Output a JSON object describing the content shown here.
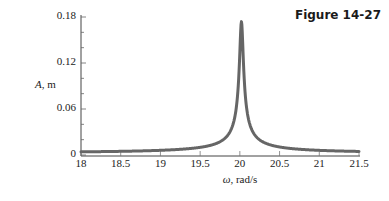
{
  "figure": {
    "label": "Figure 14-27"
  },
  "chart_data": {
    "type": "line",
    "title": "",
    "xlabel": "ω, rad/s",
    "ylabel": "A, m",
    "xlim": [
      18,
      21.5
    ],
    "ylim": [
      0,
      0.18
    ],
    "x_ticks": [
      "18",
      "18.5",
      "19",
      "19.5",
      "20",
      "20.5",
      "21",
      "21.5"
    ],
    "y_ticks": [
      "0",
      "0.06",
      "0.12",
      "0.18"
    ],
    "grid": false,
    "legend": null,
    "series": [
      {
        "name": "amplitude",
        "color": "#666666",
        "x": [
          18.0,
          18.5,
          19.0,
          19.5,
          19.8,
          19.9,
          19.95,
          20.0,
          20.02,
          20.05,
          20.1,
          20.2,
          20.5,
          21.0,
          21.5
        ],
        "values": [
          0.004,
          0.006,
          0.01,
          0.022,
          0.055,
          0.095,
          0.135,
          0.168,
          0.172,
          0.16,
          0.12,
          0.065,
          0.022,
          0.008,
          0.004
        ]
      }
    ]
  },
  "axes": {
    "y_ticks": [
      {
        "label": "0.18",
        "value": 0.18
      },
      {
        "label": "0.12",
        "value": 0.12
      },
      {
        "label": "0.06",
        "value": 0.06
      },
      {
        "label": "0",
        "value": 0
      }
    ],
    "x_ticks": [
      {
        "label": "18",
        "value": 18
      },
      {
        "label": "18.5",
        "value": 18.5
      },
      {
        "label": "19",
        "value": 19
      },
      {
        "label": "19.5",
        "value": 19.5
      },
      {
        "label": "20",
        "value": 20
      },
      {
        "label": "20.5",
        "value": 20.5
      },
      {
        "label": "21",
        "value": 21
      },
      {
        "label": "21.5",
        "value": 21.5
      }
    ],
    "ylabel_symbol": "A",
    "ylabel_unit": ", m",
    "xlabel_symbol": "ω",
    "xlabel_unit": ", rad/s"
  },
  "colors": {
    "curve": "#666666",
    "axis": "#444444",
    "text": "#222222"
  }
}
